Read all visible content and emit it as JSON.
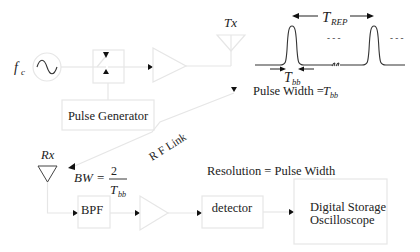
{
  "diagram": {
    "title": "",
    "transmitter": {
      "carrier_label": "f",
      "carrier_sub": "c",
      "oscillator_icon": "sine-wave-icon",
      "switch_icon": "rf-switch-icon",
      "amplifier_icon": "amplifier-icon",
      "pulse_generator_label": "Pulse Generator",
      "antenna_label": "Tx"
    },
    "waveform": {
      "period_label": "T",
      "period_sub": "REP",
      "width_label": "T",
      "width_sub": "bb",
      "ellipsis": "- - -",
      "pulse_width_text": "Pulse Width = ",
      "pulse_width_var": "T",
      "pulse_width_sub": "bb"
    },
    "link": {
      "label": "R F Link"
    },
    "receiver": {
      "antenna_label": "Rx",
      "bw_label": "BW",
      "bw_eq": "=",
      "bw_numerator": "2",
      "bw_denominator": "T",
      "bw_denominator_sub": "bb",
      "bpf_label": "BPF",
      "amplifier_icon": "amplifier-icon",
      "detector_label": "detector",
      "resolution_text": "Resolution = Pulse Width",
      "scope_line1": "Digital Storage",
      "scope_line2": "Oscilloscope"
    },
    "colors": {
      "line": "#e6e6e6",
      "text": "#222222",
      "arrow": "#111111"
    }
  }
}
